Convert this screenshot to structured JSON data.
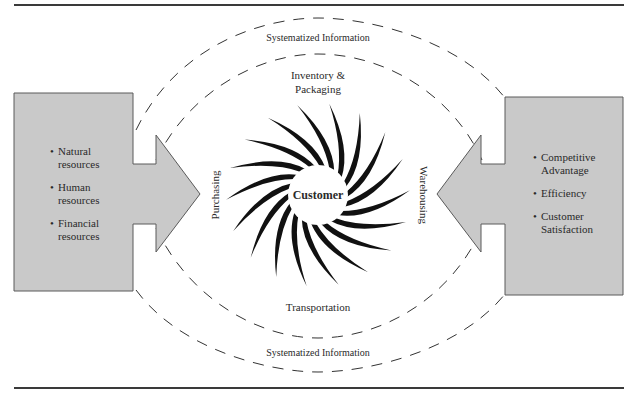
{
  "diagram": {
    "colors": {
      "box_fill": "#c9c9c9",
      "box_stroke": "#5a5a5a",
      "rule": "#3a3a3a",
      "burst": "#111111",
      "dash": "#333333"
    },
    "center": {
      "label": "Customer",
      "icon": "sunburst-icon",
      "spikes": 18
    },
    "left_box": {
      "items": [
        "Natural resources",
        "Human resources",
        "Financial resources"
      ],
      "items_lines": [
        [
          "Natural",
          "resources"
        ],
        [
          "Human",
          "resources"
        ],
        [
          "Financial",
          "resources"
        ]
      ],
      "arrow_direction": "right"
    },
    "right_box": {
      "items": [
        "Competitive Advantage",
        "Efficiency",
        "Customer Satisfaction"
      ],
      "items_lines": [
        [
          "Competitive",
          "Advantage"
        ],
        [
          "Efficiency"
        ],
        [
          "Customer",
          "Satisfaction"
        ]
      ],
      "arrow_direction": "left"
    },
    "flows": {
      "left": "Purchasing",
      "right": "Warehousing",
      "top_inner": [
        "Inventory &",
        "Packaging"
      ],
      "bottom_inner": "Transportation",
      "top_outer": "Systematized Information",
      "bottom_outer": "Systematized Information"
    }
  }
}
